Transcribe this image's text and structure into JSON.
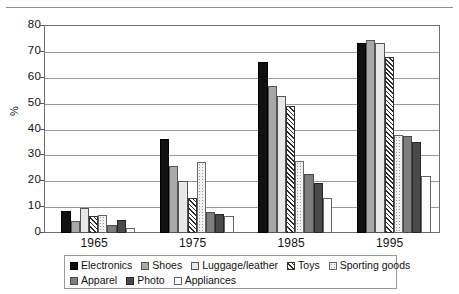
{
  "chart_data": {
    "type": "bar",
    "title": "",
    "xlabel": "",
    "ylabel": "%",
    "ylim": [
      0,
      80
    ],
    "yticks": [
      0,
      10,
      20,
      30,
      40,
      50,
      60,
      70,
      80
    ],
    "grid": true,
    "legend_position": "bottom",
    "categories": [
      "1965",
      "1975",
      "1985",
      "1995"
    ],
    "series": [
      {
        "name": "Electronics",
        "values": [
          8.5,
          36.5,
          66.0,
          73.5
        ]
      },
      {
        "name": "Shoes",
        "values": [
          4.5,
          26.0,
          57.0,
          74.5
        ]
      },
      {
        "name": "Luggage/leather",
        "values": [
          9.5,
          20.0,
          53.0,
          73.5
        ]
      },
      {
        "name": "Toys",
        "values": [
          6.5,
          13.5,
          49.0,
          68.0
        ]
      },
      {
        "name": "Sporting goods",
        "values": [
          7.0,
          27.5,
          28.0,
          38.0
        ]
      },
      {
        "name": "Apparel",
        "values": [
          3.0,
          8.0,
          23.0,
          37.5
        ]
      },
      {
        "name": "Photo",
        "values": [
          5.0,
          7.5,
          19.5,
          35.0
        ]
      },
      {
        "name": "Appliances",
        "values": [
          2.0,
          6.5,
          13.5,
          22.0
        ]
      }
    ]
  },
  "axis": {
    "y_title": "%",
    "tick_80": "80",
    "tick_70": "70",
    "tick_60": "60",
    "tick_50": "50",
    "tick_40": "40",
    "tick_30": "30",
    "tick_20": "20",
    "tick_10": "10",
    "tick_0": "0"
  },
  "xaxis": {
    "label_1965": "1965",
    "label_1975": "1975",
    "label_1985": "1985",
    "label_1995": "1995"
  },
  "legend": {
    "row1": [
      {
        "label": "Electronics",
        "fill": "f-electronics",
        "color": "#111111"
      },
      {
        "label": "Shoes",
        "fill": "f-shoes",
        "color": "#a8a8a8"
      },
      {
        "label": "Luggage/leather",
        "fill": "f-luggage",
        "color": "#e8e8e8"
      },
      {
        "label": "Toys",
        "fill": "f-toys",
        "color": "#2a2a2a"
      },
      {
        "label": "Sporting goods",
        "fill": "f-sporting",
        "color": "#f2f2f2"
      }
    ],
    "row2": [
      {
        "label": "Apparel",
        "fill": "f-apparel",
        "color": "#7d7d7d"
      },
      {
        "label": "Photo",
        "fill": "f-photo",
        "color": "#4a4a4a"
      },
      {
        "label": "Appliances",
        "fill": "f-appliances",
        "color": "#fbfbfb"
      }
    ]
  }
}
